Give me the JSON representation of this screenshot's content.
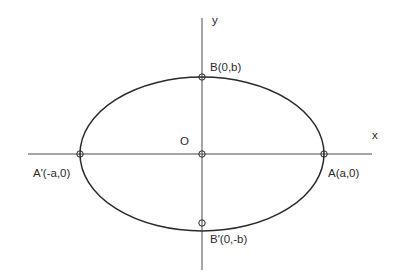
{
  "diagram": {
    "type": "ellipse-coordinate-diagram",
    "axes": {
      "x_label": "x",
      "y_label": "y",
      "origin_label": "O"
    },
    "points": [
      {
        "id": "A",
        "label": "A(a,0)"
      },
      {
        "id": "A_prime",
        "label": "A'(-a,0)"
      },
      {
        "id": "B",
        "label": "B(0,b)"
      },
      {
        "id": "B_prime",
        "label": "B'(0,-b)"
      },
      {
        "id": "O",
        "label": "O"
      }
    ],
    "colors": {
      "line": "#2a2a2a",
      "axis": "#4a4a4a",
      "background": "#ffffff"
    }
  }
}
